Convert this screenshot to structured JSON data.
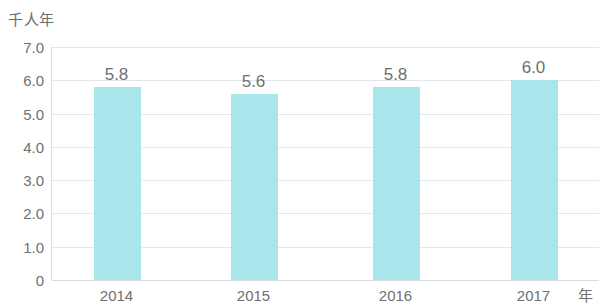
{
  "chart_data": {
    "type": "bar",
    "title": "",
    "subtitle": "",
    "xlabel": "年",
    "ylabel": "千人年",
    "categories": [
      "2014",
      "2015",
      "2016",
      "2017"
    ],
    "values": [
      5.8,
      5.6,
      5.8,
      6.0
    ],
    "data_labels": [
      "5.8",
      "5.6",
      "5.8",
      "6.0"
    ],
    "series": [
      {
        "name": "千人年",
        "values": [
          5.8,
          5.6,
          5.8,
          6.0
        ]
      }
    ],
    "ylim": [
      0,
      7.0
    ],
    "ytick_values": [
      0,
      1.0,
      2.0,
      3.0,
      4.0,
      5.0,
      6.0,
      7.0
    ],
    "ytick_labels": [
      "0",
      "1.0",
      "2.0",
      "3.0",
      "4.0",
      "5.0",
      "6.0",
      "7.0"
    ],
    "grid": true,
    "grid_axis": "y",
    "legend": false,
    "legend_position": "none",
    "bar_color": "#a8e6ec",
    "gridline_color": "#e4e7e9",
    "axis_color": "#d9dcde",
    "text_color": "#6f6f6f",
    "background_color": "#ffffff"
  }
}
